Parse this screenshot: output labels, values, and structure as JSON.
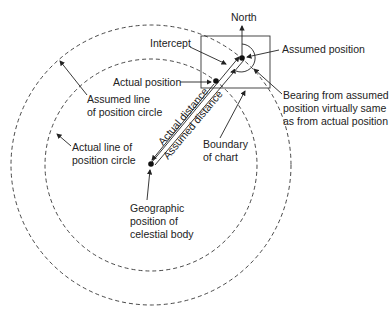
{
  "labels": {
    "north": "North",
    "intercept": "Intercept",
    "assumed_position": "Assumed position",
    "actual_position": "Actual position",
    "bearing_1": "Bearing from assumed",
    "bearing_2": "position virtually same",
    "bearing_3": "as from actual position",
    "assumed_lop_1": "Assumed line",
    "assumed_lop_2": "of position circle",
    "actual_lop_1": "Actual line of",
    "actual_lop_2": "position circle",
    "actual_distance": "Actual distance",
    "assumed_distance": "Assumed distance",
    "boundary_1": "Boundary",
    "boundary_2": "of chart",
    "geo_1": "Geographic",
    "geo_2": "position of",
    "geo_3": "celestial body"
  },
  "colors": {
    "stroke": "#222222",
    "background": "#ffffff"
  }
}
